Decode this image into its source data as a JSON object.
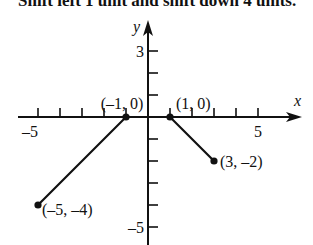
{
  "caption": {
    "text": "Shift left 1 unit and shift down 4 units."
  },
  "chart_data": {
    "type": "line",
    "title": "",
    "xlabel": "x",
    "ylabel": "y",
    "xlim": [
      -6,
      7
    ],
    "ylim": [
      -6,
      4
    ],
    "grid": false,
    "x_tick_labels": [
      {
        "value": -5,
        "label": "–5"
      },
      {
        "value": 5,
        "label": "5"
      }
    ],
    "y_tick_labels": [
      {
        "value": 3,
        "label": "3"
      },
      {
        "value": -5,
        "label": "–5"
      }
    ],
    "x_ticks": [
      -5,
      -4,
      -3,
      -2,
      -1,
      1,
      2,
      3,
      4,
      5
    ],
    "y_ticks": [
      -5,
      -4,
      -3,
      -2,
      -1,
      1,
      2,
      3
    ],
    "series": [
      {
        "name": "transformed graph",
        "x": [
          -5,
          -1,
          1,
          3
        ],
        "y": [
          -4,
          0,
          0,
          -2
        ]
      }
    ],
    "points": [
      {
        "x": -5,
        "y": -4,
        "label": "(–5, –4)"
      },
      {
        "x": -1,
        "y": 0,
        "label": "(–1, 0)"
      },
      {
        "x": 1,
        "y": 0,
        "label": "(1, 0)"
      },
      {
        "x": 3,
        "y": -2,
        "label": "(3, –2)"
      }
    ],
    "annotations": [
      "(–5, –4)",
      "(–1, 0)",
      "(1, 0)",
      "(3, –2)"
    ]
  }
}
